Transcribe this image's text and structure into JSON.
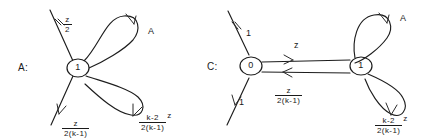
{
  "figure": {
    "type": "hand-drawn-state-diagram",
    "background": "#ffffff",
    "ink_color": "#1d1d1d"
  },
  "graphs": [
    {
      "id": "A",
      "name_label": "A:",
      "nodes": [
        {
          "id": "n1",
          "label": "1"
        }
      ],
      "incoming_edges": [
        {
          "label_numerator": "z",
          "label_denominator": "2",
          "target": "n1"
        }
      ],
      "outgoing_edges": [
        {
          "label_numerator": "z",
          "label_denominator": "2(k-1)",
          "source": "n1"
        }
      ],
      "self_loops": [
        {
          "label": "A",
          "position": "upper-right"
        },
        {
          "label_numerator": "k-2",
          "label_denominator": "2(k-1)",
          "label_trail": "z",
          "position": "lower-right"
        }
      ]
    },
    {
      "id": "C",
      "name_label": "C:",
      "nodes": [
        {
          "id": "n0",
          "label": "0"
        },
        {
          "id": "n1",
          "label": "1"
        }
      ],
      "incoming_edges": [
        {
          "label": "1",
          "target": "n0"
        }
      ],
      "outgoing_edges": [
        {
          "label": "1",
          "source": "n0"
        }
      ],
      "between_edges": [
        {
          "label": "z",
          "from": "n0",
          "to": "n1",
          "position": "top"
        },
        {
          "label_numerator": "z",
          "label_denominator": "2(k-1)",
          "from": "n1",
          "to": "n0",
          "position": "bottom"
        }
      ],
      "self_loops": [
        {
          "label": "A",
          "position": "upper-right"
        },
        {
          "label_numerator": "k-2",
          "label_denominator": "2(k-1)",
          "label_trail": "z",
          "position": "lower-right"
        }
      ]
    }
  ]
}
